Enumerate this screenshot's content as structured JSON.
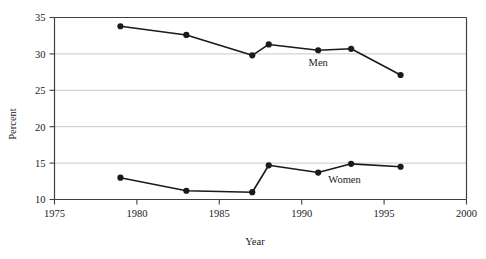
{
  "chart_data": {
    "type": "line",
    "title": "",
    "xlabel": "Year",
    "ylabel": "Percent",
    "xlim": [
      1975,
      2000
    ],
    "ylim": [
      10,
      35
    ],
    "xticks": [
      1975,
      1980,
      1985,
      1990,
      1995,
      2000
    ],
    "xtick_labels": [
      "1975",
      "1980",
      "1985",
      "1990",
      "1995",
      "2000"
    ],
    "yticks": [
      10,
      15,
      20,
      25,
      30,
      35
    ],
    "ytick_labels": [
      "10",
      "15",
      "20",
      "25",
      "30",
      "35"
    ],
    "grid": "horizontal",
    "legend_position": "inline-annotation",
    "x": [
      1979,
      1983,
      1987,
      1988,
      1991,
      1993,
      1996
    ],
    "series": [
      {
        "name": "Men",
        "label": "Men",
        "color": "#1a1a1a",
        "marker": "circle",
        "values": [
          33.8,
          32.6,
          29.8,
          31.3,
          30.5,
          30.7,
          27.1
        ],
        "label_x": 1991.0,
        "label_y": 28.3
      },
      {
        "name": "Women",
        "label": "Women",
        "color": "#1a1a1a",
        "marker": "circle",
        "values": [
          13.0,
          11.2,
          11.0,
          14.7,
          13.7,
          14.9,
          14.5
        ],
        "label_x": 1992.6,
        "label_y": 12.2
      }
    ]
  },
  "style": {
    "axis_color": "#404040",
    "grid_color": "#c8c8c8",
    "line_color": "#1a1a1a",
    "background": "#ffffff"
  }
}
